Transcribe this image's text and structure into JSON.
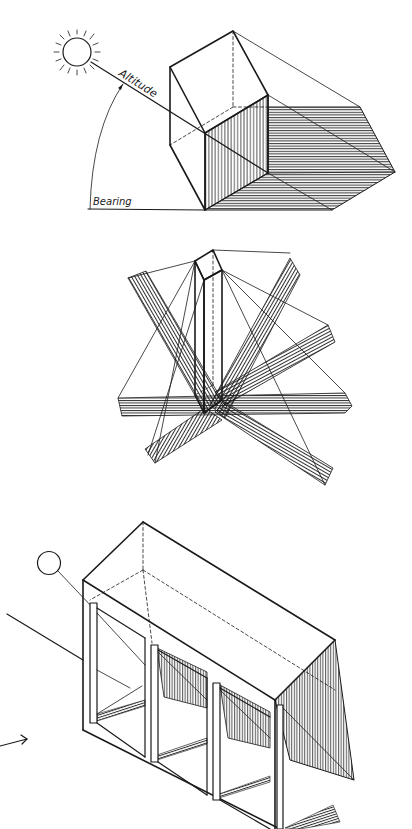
{
  "figures": [
    {
      "id": "fig-sun-angle",
      "labels": {
        "altitude": "Altitude",
        "bearing": "Bearing"
      }
    },
    {
      "id": "fig-shadow-rotation"
    },
    {
      "id": "fig-shelf-shadow"
    }
  ],
  "colors": {
    "ink": "#1a1a1a",
    "paper": "#ffffff"
  }
}
